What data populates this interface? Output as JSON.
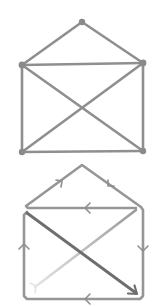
{
  "figure": {
    "colors": {
      "edge": "#8f8f8f",
      "vertex": "#8a8a8a",
      "path_start_faint": "#e2e2e2",
      "path_end_dark": "#6e6e6e",
      "background": "#ffffff"
    }
  },
  "graph": {
    "vertices": [
      {
        "id": "apex",
        "x": 82,
        "y": 22
      },
      {
        "id": "top-left",
        "x": 22,
        "y": 65
      },
      {
        "id": "top-right",
        "x": 143,
        "y": 63
      },
      {
        "id": "bottom-left",
        "x": 22,
        "y": 152
      },
      {
        "id": "bottom-right",
        "x": 143,
        "y": 151
      }
    ],
    "edges": [
      [
        "top-left",
        "apex"
      ],
      [
        "apex",
        "top-right"
      ],
      [
        "top-left",
        "top-right"
      ],
      [
        "top-left",
        "bottom-left"
      ],
      [
        "top-right",
        "bottom-right"
      ],
      [
        "bottom-left",
        "bottom-right"
      ],
      [
        "top-left",
        "bottom-right"
      ],
      [
        "top-right",
        "bottom-left"
      ]
    ]
  },
  "euler_path": {
    "order": [
      "bottom-left",
      "top-right",
      "top-left",
      "apex",
      "top-right",
      "bottom-right",
      "bottom-left",
      "top-left",
      "bottom-right"
    ],
    "arrows": [
      {
        "edge": "top-left→apex",
        "direction": "up-right"
      },
      {
        "edge": "apex→top-right",
        "direction": "down-right"
      },
      {
        "edge": "top-right→top-left",
        "direction": "left"
      },
      {
        "edge": "top-right→bottom-right",
        "direction": "down"
      },
      {
        "edge": "bottom-right→bottom-left",
        "direction": "left"
      },
      {
        "edge": "bottom-left→top-left",
        "direction": "up"
      },
      {
        "edge": "top-left→bottom-right",
        "direction": "arrowhead-at-end"
      }
    ]
  }
}
